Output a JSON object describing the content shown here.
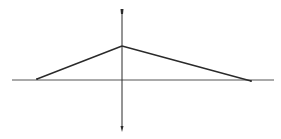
{
  "diagram": {
    "type": "lens-ray-diagram",
    "colors": {
      "background": "#ffffff",
      "stroke": "#2a2a2a",
      "axis": "#555555"
    },
    "optical_axis": {
      "x1": 12,
      "y1": 80,
      "x2": 274,
      "y2": 80
    },
    "lens": {
      "x": 122,
      "y_top": 10,
      "y_bottom": 130,
      "top_arrow": "arrow-up",
      "bottom_arrow": "arrow-down"
    },
    "rays": [
      {
        "from": [
          37,
          79
        ],
        "to": [
          122,
          46
        ]
      },
      {
        "from": [
          122,
          46
        ],
        "to": [
          251,
          81
        ]
      }
    ],
    "points": {
      "object": [
        37,
        79
      ],
      "apex": [
        122,
        46
      ],
      "image": [
        251,
        81
      ]
    }
  }
}
